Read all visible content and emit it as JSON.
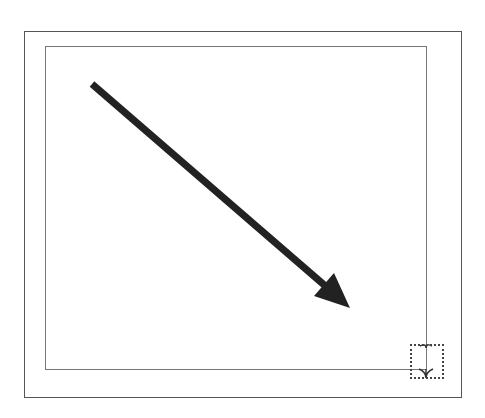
{
  "canvas": {
    "outer_frame": {
      "x": 24,
      "y": 31,
      "w": 438,
      "h": 367,
      "color": "#555555"
    },
    "inner_frame": {
      "x": 45,
      "y": 46,
      "w": 382,
      "h": 324,
      "color": "#777777"
    },
    "arrow": {
      "start": [
        92,
        84
      ],
      "end": [
        350,
        308
      ],
      "head": [
        [
          350,
          308
        ],
        [
          314,
          296
        ],
        [
          334,
          273
        ]
      ],
      "stroke_width": 7,
      "color": "#222222",
      "label": "arrow-shape"
    },
    "resize_handle": {
      "x": 410,
      "y": 344,
      "w": 34,
      "h": 35,
      "style": "dotted"
    }
  }
}
